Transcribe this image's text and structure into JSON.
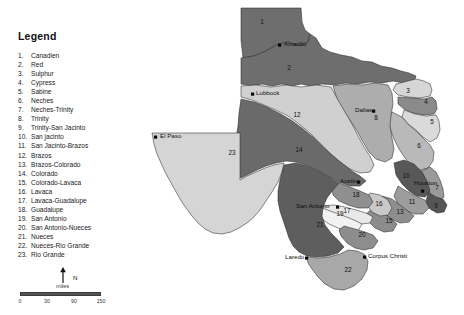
{
  "legend": {
    "title": "Legend",
    "items": [
      {
        "num": "1.",
        "name": "Canadien"
      },
      {
        "num": "2.",
        "name": "Red"
      },
      {
        "num": "3.",
        "name": "Sulphur"
      },
      {
        "num": "4.",
        "name": "Cypress"
      },
      {
        "num": "5.",
        "name": "Sabine"
      },
      {
        "num": "6.",
        "name": "Neches"
      },
      {
        "num": "7.",
        "name": "Neches-Trinity"
      },
      {
        "num": "8.",
        "name": "Trinity"
      },
      {
        "num": "9.",
        "name": "Trinity-San Jacinto"
      },
      {
        "num": "10.",
        "name": "San jacinto"
      },
      {
        "num": "11.",
        "name": "San Jacinto-Brazos"
      },
      {
        "num": "12.",
        "name": "Brazos"
      },
      {
        "num": "13.",
        "name": "Brazos-Colorado"
      },
      {
        "num": "14.",
        "name": "Colorado"
      },
      {
        "num": "15.",
        "name": "Colorado-Lavaca"
      },
      {
        "num": "16.",
        "name": "Lavaca"
      },
      {
        "num": "17.",
        "name": "Lavaca-Guadalupe"
      },
      {
        "num": "18.",
        "name": "Guadalupe"
      },
      {
        "num": "19.",
        "name": "San Antonio"
      },
      {
        "num": "20.",
        "name": "San Antonio-Nueces"
      },
      {
        "num": "21.",
        "name": "Nueces"
      },
      {
        "num": "22.",
        "name": "Nueces-Rio Grande"
      },
      {
        "num": "23.",
        "name": "Rio Grande"
      }
    ]
  },
  "scale": {
    "north_label": "N",
    "unit_label": "miles",
    "ticks": [
      "0",
      "30",
      "90",
      "150"
    ],
    "bar_color": "#555555"
  },
  "map": {
    "cities": [
      {
        "name": "Amarillo",
        "x": 284,
        "y": 46,
        "dot_x": 278,
        "dot_y": 43.5,
        "anchor": "start"
      },
      {
        "name": "Lubbock",
        "x": 256,
        "y": 95,
        "dot_x": 251,
        "dot_y": 92.5,
        "anchor": "start"
      },
      {
        "name": "El Paso",
        "x": 160,
        "y": 138,
        "dot_x": 154,
        "dot_y": 135.5,
        "anchor": "start"
      },
      {
        "name": "Dallas",
        "x": 355,
        "y": 112,
        "dot_x": 372,
        "dot_y": 109.5,
        "anchor": "start"
      },
      {
        "name": "Austin",
        "x": 340,
        "y": 183,
        "dot_x": 357,
        "dot_y": 180.5,
        "anchor": "start"
      },
      {
        "name": "San Antonio",
        "x": 296,
        "y": 208,
        "dot_x": 336,
        "dot_y": 205.5,
        "anchor": "start"
      },
      {
        "name": "Houston",
        "x": 414,
        "y": 185,
        "dot_x": 421,
        "dot_y": 189.5,
        "anchor": "start"
      },
      {
        "name": "Laredo",
        "x": 285,
        "y": 259,
        "dot_x": 305,
        "dot_y": 256.5,
        "anchor": "start"
      },
      {
        "name": "Corpus Christi",
        "x": 368,
        "y": 258,
        "dot_x": 363,
        "dot_y": 255.5,
        "anchor": "start"
      }
    ],
    "basin_labels": [
      {
        "num": "1",
        "x": 262,
        "y": 24
      },
      {
        "num": "2",
        "x": 289,
        "y": 70
      },
      {
        "num": "3",
        "x": 408,
        "y": 93
      },
      {
        "num": "4",
        "x": 426,
        "y": 104
      },
      {
        "num": "5",
        "x": 432,
        "y": 124
      },
      {
        "num": "6",
        "x": 419,
        "y": 148
      },
      {
        "num": "7",
        "x": 437,
        "y": 190
      },
      {
        "num": "8",
        "x": 376,
        "y": 120
      },
      {
        "num": "9",
        "x": 436,
        "y": 208
      },
      {
        "num": "10",
        "x": 406,
        "y": 178
      },
      {
        "num": "11",
        "x": 412,
        "y": 204
      },
      {
        "num": "12",
        "x": 297,
        "y": 117
      },
      {
        "num": "13",
        "x": 400,
        "y": 214
      },
      {
        "num": "14",
        "x": 299,
        "y": 152
      },
      {
        "num": "15",
        "x": 389,
        "y": 223
      },
      {
        "num": "16",
        "x": 379,
        "y": 206
      },
      {
        "num": "17",
        "x": 347,
        "y": 213
      },
      {
        "num": "18",
        "x": 356,
        "y": 197
      },
      {
        "num": "19",
        "x": 340,
        "y": 216
      },
      {
        "num": "20",
        "x": 362,
        "y": 237
      },
      {
        "num": "21",
        "x": 320,
        "y": 227
      },
      {
        "num": "22",
        "x": 348,
        "y": 272
      },
      {
        "num": "23",
        "x": 232,
        "y": 155
      }
    ],
    "basin_fills": {
      "1": "#6e6e6e",
      "2": "#6e6e6e",
      "3": "#d6d6d6",
      "4": "#8a8a8a",
      "5": "#dadada",
      "6": "#b9b9b9",
      "7": "#9a9a9a",
      "8": "#adadad",
      "9": "#555555",
      "10": "#585858",
      "11": "#9d9d9d",
      "12": "#d0d0d0",
      "13": "#8e8e8e",
      "14": "#6a6a6a",
      "15": "#8c8c8c",
      "16": "#c9c9c9",
      "17": "#e8e8e8",
      "18": "#8f8f8f",
      "19": "#f1f1f1",
      "20": "#8d8d8d",
      "21": "#5e5e5e",
      "22": "#a8a8a8",
      "23": "#d5d5d5"
    }
  }
}
